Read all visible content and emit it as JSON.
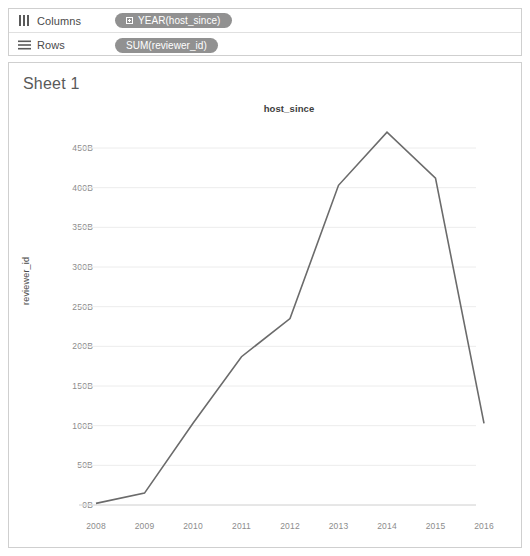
{
  "shelves": {
    "columns": {
      "icon": "columns-icon",
      "label": "Columns",
      "pill": "YEAR(host_since)",
      "pill_icon": "expand-plus-icon"
    },
    "rows": {
      "icon": "rows-icon",
      "label": "Rows",
      "pill": "SUM(reviewer_id)"
    }
  },
  "sheet": {
    "title": "Sheet 1"
  },
  "chart_data": {
    "type": "line",
    "title": "host_since",
    "xlabel": "",
    "ylabel": "reviewer_id",
    "x": [
      "2008",
      "2009",
      "2010",
      "2011",
      "2012",
      "2013",
      "2014",
      "2015",
      "2016"
    ],
    "values": [
      2,
      15,
      103,
      187,
      235,
      403,
      470,
      412,
      103
    ],
    "value_unit": "B",
    "ylim": [
      0,
      470
    ],
    "yticks": [
      "0B",
      "50B",
      "100B",
      "150B",
      "200B",
      "250B",
      "300B",
      "350B",
      "400B",
      "450B"
    ],
    "ytick_values": [
      0,
      50,
      100,
      150,
      200,
      250,
      300,
      350,
      400,
      450
    ],
    "grid": true,
    "legend": "none",
    "line_color": "#6b6b6b"
  }
}
